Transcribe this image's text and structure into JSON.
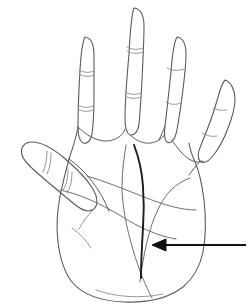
{
  "figure": {
    "background_color": "#ffffff",
    "width": 250,
    "height": 308
  },
  "colors": {
    "outline": "#5a5a64",
    "crease": "#8a8a94",
    "palm_line": "#6e6e78",
    "highlight_line": "#1c1c1c",
    "arrow": "#111111",
    "background": "#ffffff"
  },
  "stroke_widths": {
    "outline": 1.1,
    "crease": 0.9,
    "palm_line": 1.0,
    "highlight_line": 1.9,
    "arrow": 2.2
  },
  "parts": {
    "hand_outline": "hand-outline",
    "thumb": "thumb",
    "index_finger": "index-finger",
    "middle_finger": "middle-finger",
    "ring_finger": "ring-finger",
    "little_finger": "little-finger",
    "palm": "palm",
    "wrist": "wrist"
  },
  "palm_lines": [
    {
      "name": "heart-line",
      "emphasis": "normal"
    },
    {
      "name": "head-line",
      "emphasis": "normal"
    },
    {
      "name": "life-line",
      "emphasis": "normal"
    },
    {
      "name": "fate-line",
      "emphasis": "bold"
    }
  ],
  "annotation": {
    "arrow": {
      "name": "pointer-arrow",
      "direction": "left",
      "tail_x": 246,
      "tail_y": 245,
      "tip_x": 152,
      "tip_y": 245,
      "points_to": "fate-line"
    }
  },
  "labels": {
    "text_items": []
  }
}
